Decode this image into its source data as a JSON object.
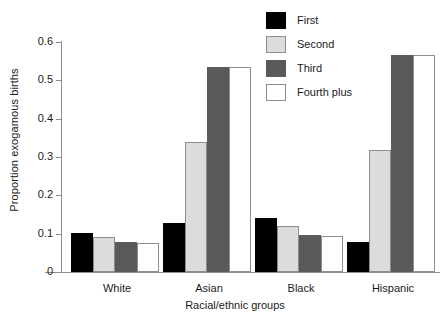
{
  "chart_data": {
    "type": "bar",
    "title": "",
    "xlabel": "Racial/ethnic groups",
    "ylabel": "Proportion exogamous births",
    "categories": [
      "White",
      "Asian",
      "Black",
      "Hispanic"
    ],
    "series": [
      {
        "name": "First",
        "color": "#000000",
        "values": [
          0.101,
          0.128,
          0.14,
          0.078
        ]
      },
      {
        "name": "Second",
        "color": "#dcdcdc",
        "values": [
          0.091,
          0.34,
          0.12,
          0.317
        ]
      },
      {
        "name": "Third",
        "color": "#5a5a5a",
        "values": [
          0.078,
          0.534,
          0.097,
          0.565
        ]
      },
      {
        "name": "Fourth plus",
        "color": "#ffffff",
        "values": [
          0.076,
          0.535,
          0.095,
          0.565
        ]
      }
    ],
    "ylim": [
      0,
      0.6
    ],
    "yticks": [
      0,
      0.1,
      0.2,
      0.3,
      0.4,
      0.5,
      0.6
    ],
    "ytick_labels": [
      "0",
      "0.1",
      "0.2",
      "0.3",
      "0.4",
      "0.5",
      "0.6"
    ],
    "grid": false,
    "legend_position": "top-right"
  }
}
